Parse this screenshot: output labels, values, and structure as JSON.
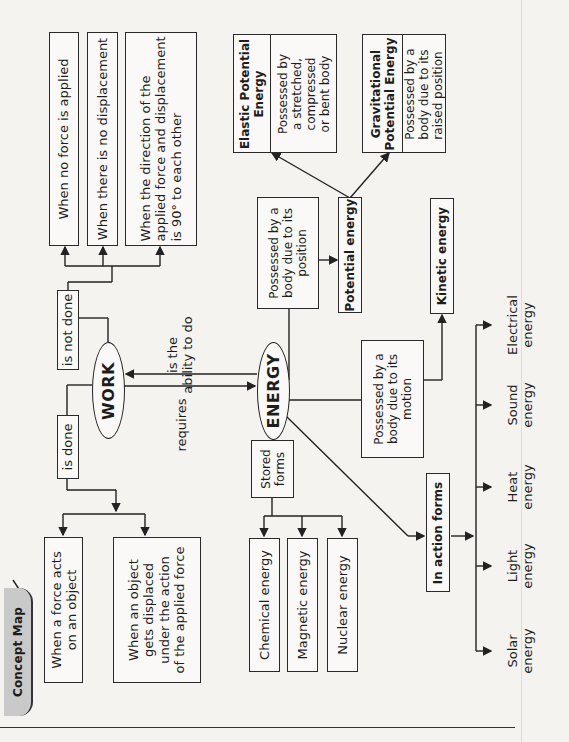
{
  "tab": {
    "label": "Concept Map"
  },
  "nodes": {
    "work": "WORK",
    "energy": "ENERGY",
    "is_done": "is done",
    "is_not_done": "is not done",
    "requires": "requires",
    "ability_line1": "is the",
    "ability_line2": "ability to do",
    "not_done_cases": [
      {
        "lines": [
          "When no force is applied"
        ]
      },
      {
        "lines": [
          "When there is no displacement"
        ]
      },
      {
        "lines": [
          "When the direction of the",
          "applied force and displacement",
          "is 90° to each other"
        ]
      }
    ],
    "done_cases": [
      {
        "lines": [
          "When a force acts",
          "on an object"
        ]
      },
      {
        "lines": [
          "When an object",
          "gets displaced",
          "under the action",
          "of the applied force"
        ]
      }
    ],
    "elastic": {
      "title_lines": [
        "Elastic Potential",
        "Energy"
      ],
      "desc_lines": [
        "Possessed by",
        "a stretched,",
        "compressed",
        "or bent body"
      ]
    },
    "gravitational": {
      "title_lines": [
        "Gravitational",
        "Potential Energy"
      ],
      "desc_lines": [
        "Possessed by a",
        "body due to its",
        "raised position"
      ]
    },
    "position_desc": [
      "Possessed by a",
      "body due to its",
      "position"
    ],
    "potential_energy": "Potential energy",
    "kinetic_energy": "Kinetic energy",
    "motion_desc": [
      "Possessed by a",
      "body due to its",
      "motion"
    ],
    "stored_forms": [
      "Stored",
      "forms"
    ],
    "stored_items": [
      "Chemical energy",
      "Magnetic energy",
      "Nuclear energy"
    ],
    "in_action_forms": "In action forms",
    "action_items": [
      {
        "lines": [
          "Electrical",
          "energy"
        ]
      },
      {
        "lines": [
          "Sound",
          "energy"
        ]
      },
      {
        "lines": [
          "Heat",
          "energy"
        ]
      },
      {
        "lines": [
          "Light",
          "energy"
        ]
      },
      {
        "lines": [
          "Solar",
          "energy"
        ]
      }
    ]
  }
}
